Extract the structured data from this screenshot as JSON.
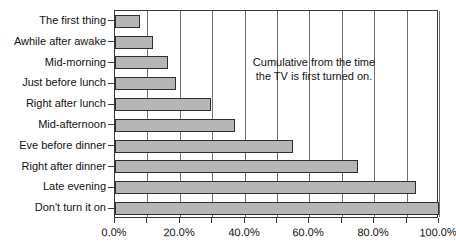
{
  "chart_data": {
    "type": "bar",
    "orientation": "horizontal",
    "title": "",
    "xlabel": "",
    "ylabel": "",
    "categories": [
      "The first thing",
      "Awhile after awake",
      "Mid-morning",
      "Just before lunch",
      "Right after lunch",
      "Mid-afternoon",
      "Eve before dinner",
      "Right after dinner",
      "Late evening",
      "Don't turn it on"
    ],
    "values": [
      7.7,
      11.7,
      16.4,
      18.8,
      29.6,
      37.0,
      55.0,
      75.0,
      93.0,
      100.0
    ],
    "xlim": [
      0,
      100
    ],
    "xticks": [
      0,
      10,
      20,
      30,
      40,
      50,
      60,
      70,
      80,
      90,
      100
    ],
    "xtick_labels": [
      "0.0%",
      "20.0%",
      "40.0%",
      "60.0%",
      "80.0%",
      "100.0%"
    ],
    "xtick_label_values": [
      0,
      20,
      40,
      60,
      80,
      100
    ],
    "grid": true,
    "legend": false,
    "annotations": [
      {
        "text": "Cumulative from the time the TV is first turned on.",
        "line1": "Cumulative from the time",
        "line2": "the TV is first turned on."
      }
    ],
    "colors": {
      "bar_fill": "#b5b5b5",
      "bar_edge": "#2f2f2f",
      "gridline": "#6e6e6e",
      "frame": "#3a3a3a",
      "text": "#111111",
      "background": "#ffffff"
    }
  }
}
